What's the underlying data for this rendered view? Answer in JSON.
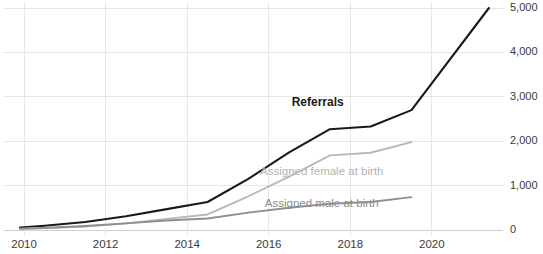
{
  "chart_data": {
    "type": "line",
    "title": "",
    "subtitle": "",
    "xlabel": "",
    "ylabel": "",
    "xlim": [
      2009.9,
      2021.5
    ],
    "ylim": [
      0,
      5000
    ],
    "grid": "both",
    "legend_position": "inline-annotations",
    "x_ticks": [
      "2010",
      "2012",
      "2014",
      "2016",
      "2018",
      "2020"
    ],
    "x_tick_values": [
      2010,
      2012,
      2014,
      2016,
      2018,
      2020
    ],
    "y_ticks": [
      "0",
      "1,000",
      "2,000",
      "3,000",
      "4,000",
      "5,000"
    ],
    "y_tick_values": [
      0,
      1000,
      2000,
      3000,
      4000,
      5000
    ],
    "y_axis_side": "right",
    "series": [
      {
        "name": "Referrals",
        "color": "#1a1a1a",
        "stroke_width": 2.1,
        "label_x": 2017.2,
        "label_y": 2800,
        "x": [
          2009.9,
          2010.5,
          2011.5,
          2012.5,
          2013.5,
          2014.5,
          2015.5,
          2016.5,
          2017.5,
          2018.5,
          2019.5,
          2021.4
        ],
        "values": [
          55,
          95,
          180,
          310,
          470,
          630,
          1150,
          1750,
          2270,
          2330,
          2700,
          5000
        ]
      },
      {
        "name": "Assigned female at birth",
        "color": "#b8b8b8",
        "stroke_width": 1.9,
        "label_x": 2017.3,
        "label_y": 1250,
        "x": [
          2009.9,
          2010.5,
          2011.5,
          2012.5,
          2013.5,
          2014.5,
          2015.5,
          2016.5,
          2017.5,
          2018.5,
          2019.5
        ],
        "values": [
          30,
          45,
          80,
          150,
          250,
          350,
          760,
          1200,
          1680,
          1740,
          1980
        ]
      },
      {
        "name": "Assigned male at birth",
        "color": "#8f8f8f",
        "stroke_width": 1.9,
        "label_x": 2017.3,
        "label_y": 510,
        "x": [
          2009.9,
          2010.5,
          2011.5,
          2012.5,
          2013.5,
          2014.5,
          2015.5,
          2016.5,
          2017.5,
          2018.5,
          2019.5
        ],
        "values": [
          25,
          45,
          90,
          150,
          215,
          260,
          390,
          500,
          590,
          630,
          740
        ]
      }
    ]
  }
}
